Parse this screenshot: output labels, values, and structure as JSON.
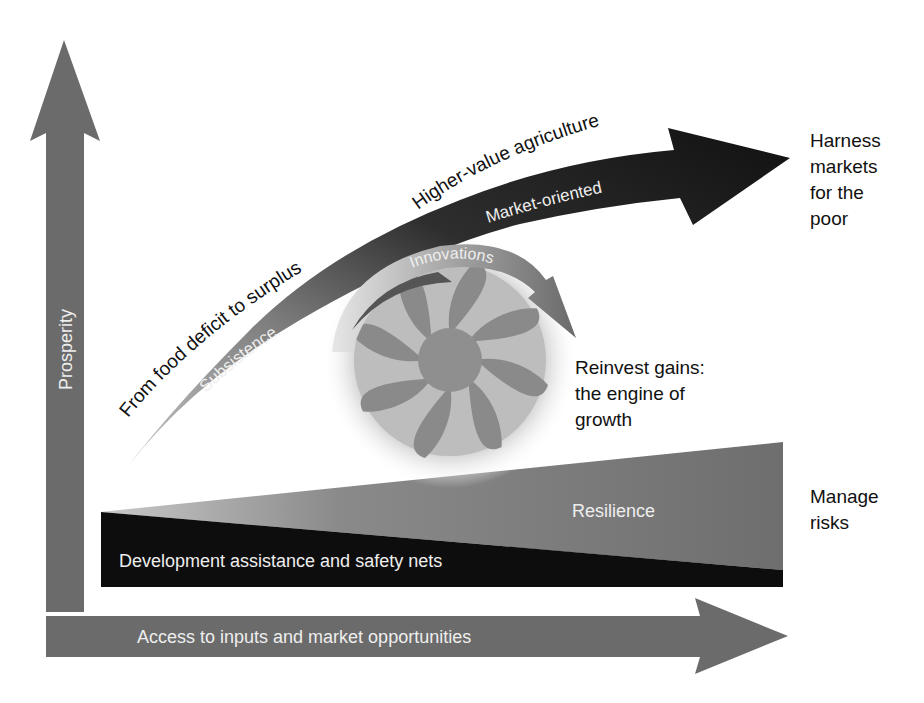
{
  "axes": {
    "y_label": "Prosperity",
    "x_label": "Access to inputs and market opportunities"
  },
  "growth_curve": {
    "outer_label_lower": "From food deficit to surplus",
    "outer_label_upper": "Higher-value agriculture",
    "inner_label_lower": "Subsistence",
    "inner_label_upper": "Market-oriented"
  },
  "engine": {
    "arrow_label": "Innovations",
    "caption_line1": "Reinvest gains:",
    "caption_line2": "the engine of",
    "caption_line3": "growth"
  },
  "base_layers": {
    "upper_wedge_label": "Resilience",
    "lower_wedge_label": "Development assistance and safety nets"
  },
  "side_labels": {
    "markets_line1": "Harness",
    "markets_line2": "markets",
    "markets_line3": "for the",
    "markets_line4": "poor",
    "risks_line1": "Manage",
    "risks_line2": "risks"
  },
  "colors": {
    "axis_gray": "#6b6b6b",
    "resilience_gray": "#777777",
    "safety_black": "#0d0d0d",
    "market_arrow_black": "#1a1a1a",
    "fan_gray": "#8a8a8a"
  }
}
